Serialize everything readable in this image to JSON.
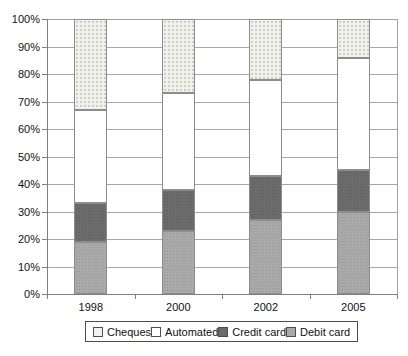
{
  "chart_data": {
    "type": "bar",
    "subtype": "stacked-100-percent",
    "title": "",
    "xlabel": "",
    "ylabel": "",
    "categories": [
      "1998",
      "2000",
      "2002",
      "2005"
    ],
    "series": [
      {
        "name": "Debit card",
        "values": [
          19,
          23,
          27,
          30
        ],
        "color": "#a9a9a9",
        "texture": "noise"
      },
      {
        "name": "Credit card",
        "values": [
          14,
          15,
          16,
          15
        ],
        "color": "#6b6b6b",
        "texture": "noise"
      },
      {
        "name": "Automated",
        "values": [
          34,
          35,
          35,
          41
        ],
        "color": "#ffffff",
        "texture": "none"
      },
      {
        "name": "Cheques",
        "values": [
          33,
          27,
          22,
          14
        ],
        "color": "#f2f2ec",
        "texture": "speckle"
      }
    ],
    "stack_order": "bottom-to-top",
    "legend_order": [
      "Cheques",
      "Automated",
      "Credit card",
      "Debit card"
    ],
    "legend_position": "bottom",
    "y_axis": {
      "min": 0,
      "max": 100,
      "step": 10,
      "tick_labels": [
        "0%",
        "10%",
        "20%",
        "30%",
        "40%",
        "50%",
        "60%",
        "70%",
        "80%",
        "90%",
        "100%"
      ]
    },
    "grid": true,
    "colors": {
      "background": "#ffffff",
      "gridline": "#a8a8a8",
      "axis": "#7f7f7f",
      "segment_border": "#8c8c8c",
      "text": "#111111",
      "legend_border": "#4d4d4d"
    }
  }
}
